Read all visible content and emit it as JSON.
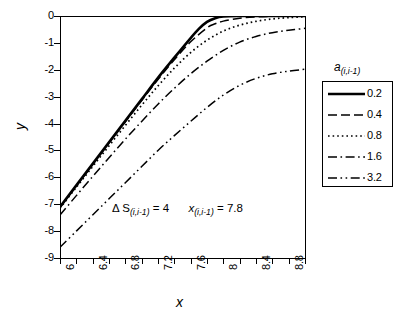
{
  "chart_data": {
    "type": "line",
    "title": "",
    "xlabel": "x",
    "ylabel": "y",
    "xlim": [
      6,
      9
    ],
    "ylim": [
      -9,
      0
    ],
    "grid": false,
    "legend_position": "right",
    "legend_title": "a (i,i-1)",
    "x_ticks": [
      6,
      6.2,
      6.4,
      6.6,
      6.8,
      7,
      7.2,
      7.4,
      7.6,
      7.8,
      8,
      8.2,
      8.4,
      8.6,
      8.8,
      9
    ],
    "x_tick_labels": [
      "6",
      "",
      "6.4",
      "",
      "6.8",
      "",
      "7.2",
      "",
      "7.6",
      "",
      "8",
      "",
      "8.4",
      "",
      "8.8",
      ""
    ],
    "y_ticks": [
      0,
      -1,
      -2,
      -3,
      -4,
      -5,
      -6,
      -7,
      -8,
      -9
    ],
    "y_tick_labels": [
      "0",
      "-1",
      "-2",
      "-3",
      "-4",
      "-5",
      "-6",
      "-7",
      "-8",
      "-9"
    ],
    "annotations": [
      {
        "text": "Δ S(i,i-1) = 4    x (i,i-1) = 7.8",
        "delta_symbol": "Δ",
        "s_label": "S",
        "s_subscript": "(i,i-1)",
        "s_equals": "= 4",
        "x_label": "x",
        "x_subscript": "(i,i-1)",
        "x_equals": "= 7.8",
        "x_pos": 7.05,
        "y_pos": -7.1
      }
    ],
    "series": [
      {
        "name": "0.2",
        "style": "solid",
        "x": [
          6.0,
          6.2,
          6.4,
          6.6,
          6.8,
          7.0,
          7.2,
          7.4,
          7.6,
          7.7,
          7.8,
          7.9,
          8.0,
          8.2,
          8.4,
          8.6,
          8.8,
          9.0
        ],
        "y": [
          -7.1,
          -6.3,
          -5.5,
          -4.7,
          -3.9,
          -3.1,
          -2.3,
          -1.55,
          -0.82,
          -0.48,
          -0.22,
          -0.08,
          -0.02,
          0.0,
          0.0,
          0.0,
          0.0,
          0.0
        ]
      },
      {
        "name": "0.4",
        "style": "dashed",
        "x": [
          6.0,
          6.2,
          6.4,
          6.6,
          6.8,
          7.0,
          7.2,
          7.4,
          7.6,
          7.8,
          7.9,
          8.0,
          8.2,
          8.4,
          8.6,
          8.8,
          9.0
        ],
        "y": [
          -7.12,
          -6.32,
          -5.52,
          -4.72,
          -3.93,
          -3.14,
          -2.36,
          -1.63,
          -0.96,
          -0.44,
          -0.29,
          -0.19,
          -0.08,
          -0.03,
          -0.01,
          0.0,
          0.0
        ]
      },
      {
        "name": "0.8",
        "style": "dotted",
        "x": [
          6.0,
          6.2,
          6.4,
          6.6,
          6.8,
          7.0,
          7.2,
          7.4,
          7.6,
          7.8,
          8.0,
          8.2,
          8.4,
          8.6,
          8.8,
          9.0
        ],
        "y": [
          -7.15,
          -6.37,
          -5.6,
          -4.83,
          -4.07,
          -3.32,
          -2.6,
          -1.94,
          -1.36,
          -0.9,
          -0.56,
          -0.34,
          -0.2,
          -0.11,
          -0.06,
          -0.03
        ]
      },
      {
        "name": "1.6",
        "style": "dashdot",
        "x": [
          6.0,
          6.2,
          6.4,
          6.6,
          6.8,
          7.0,
          7.2,
          7.4,
          7.6,
          7.8,
          8.0,
          8.2,
          8.4,
          8.6,
          8.8,
          9.0
        ],
        "y": [
          -7.4,
          -6.68,
          -5.97,
          -5.27,
          -4.58,
          -3.92,
          -3.28,
          -2.69,
          -2.15,
          -1.68,
          -1.28,
          -0.97,
          -0.76,
          -0.62,
          -0.53,
          -0.46
        ]
      },
      {
        "name": "3.2",
        "style": "dashdotdot",
        "x": [
          6.0,
          6.2,
          6.4,
          6.6,
          6.8,
          7.0,
          7.2,
          7.4,
          7.6,
          7.8,
          8.0,
          8.2,
          8.4,
          8.6,
          8.8,
          9.0
        ],
        "y": [
          -8.6,
          -8.0,
          -7.4,
          -6.8,
          -6.2,
          -5.6,
          -5.0,
          -4.45,
          -3.92,
          -3.4,
          -2.94,
          -2.58,
          -2.32,
          -2.15,
          -2.05,
          -1.98
        ]
      }
    ]
  },
  "legend": {
    "title_a": "a",
    "title_sub": "(i,i-1)",
    "entries": [
      {
        "label": "0.2",
        "style": "solid"
      },
      {
        "label": "0.4",
        "style": "dashed"
      },
      {
        "label": "0.8",
        "style": "dotted"
      },
      {
        "label": "1.6",
        "style": "dashdot"
      },
      {
        "label": "3.2",
        "style": "dashdotdot"
      }
    ]
  },
  "axes": {
    "x_title": "x",
    "y_title": "y"
  }
}
